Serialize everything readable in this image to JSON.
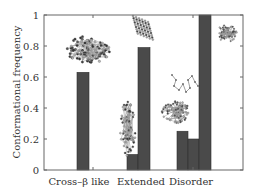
{
  "chart_data": {
    "type": "bar",
    "title": "",
    "xlabel": "",
    "ylabel": "Conformational frequency",
    "ylim": [
      0,
      1
    ],
    "yticks": [
      0,
      0.2,
      0.4,
      0.6,
      0.8,
      1
    ],
    "ytick_labels": [
      "0",
      "0.2",
      "0.4",
      "0.6",
      "0.8",
      "1"
    ],
    "grid": false,
    "legend": null,
    "categories": [
      "Cross–β like",
      "Extended",
      "Disorder"
    ],
    "bars": [
      {
        "category": "Cross–β like",
        "index": 0,
        "value": 0.63,
        "x0": 77,
        "x1": 89
      },
      {
        "category": "Extended",
        "index": 0,
        "value": 0.1,
        "x0": 127,
        "x1": 138
      },
      {
        "category": "Extended",
        "index": 1,
        "value": 0.79,
        "x0": 138,
        "x1": 150
      },
      {
        "category": "Disorder",
        "index": 0,
        "value": 0.25,
        "x0": 177,
        "x1": 188
      },
      {
        "category": "Disorder",
        "index": 1,
        "value": 0.2,
        "x0": 188,
        "x1": 199
      },
      {
        "category": "Disorder",
        "index": 2,
        "value": 1.0,
        "x0": 199,
        "x1": 211
      }
    ],
    "bar_color": "#4a4a4a",
    "annotations": [
      "molecular structure image: compact sheet-like aggregate above Cross-β like bar",
      "molecular structure image: parallel extended strands above tall Extended bar",
      "molecular structure image: elongated bead cluster left of tall Extended bar",
      "molecular structure image: loose coil chains above Disorder bars",
      "molecular structure image: globular cluster left of Disorder bars",
      "molecular structure image: globular cluster right of tallest Disorder bar"
    ]
  },
  "layout": {
    "plot": {
      "left": 44,
      "right": 243,
      "top": 15,
      "bottom": 170
    },
    "category_label_x": [
      79,
      141,
      191
    ],
    "xtick_marks_x": [
      93,
      193
    ]
  }
}
